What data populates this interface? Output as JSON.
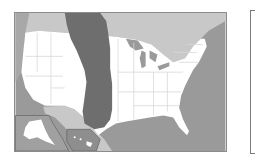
{
  "map": {
    "subject": "United States",
    "highlighted_region": "central north-south band (Great Plains)",
    "insets": [
      "Alaska",
      "Hawaii"
    ],
    "colors": {
      "ocean": "#9a9a9a",
      "neighbor_land": "#c8c8c8",
      "states": "#ffffff",
      "state_borders": "#d8d8d8",
      "highlight": "#6e6e6e",
      "lakes": "#9a9a9a",
      "frame": "#8c8c8c"
    }
  },
  "side_panel": {
    "content": ""
  }
}
